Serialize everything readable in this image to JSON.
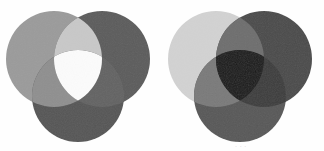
{
  "figure": {
    "width": 324,
    "height": 151,
    "background_color": "#fefefe",
    "panel_count": 2
  },
  "chart_data": {
    "type": "diagram",
    "subtype": "venn-3-set",
    "xlabel": "",
    "ylabel": "",
    "grid": false,
    "legend": "none",
    "panels": [
      {
        "name": "left-venn",
        "label": "additive",
        "blend_mode": "lighten",
        "center_region_color": "#fbfbfb",
        "sets": [
          {
            "id": "A",
            "label": "",
            "color": "#9b9b9b",
            "cx": 54,
            "cy": 59,
            "r": 48
          },
          {
            "id": "B",
            "label": "",
            "color": "#5c5c5c",
            "cx": 102,
            "cy": 59,
            "r": 48
          },
          {
            "id": "C",
            "label": "",
            "color": "#565656",
            "cx": 78,
            "cy": 96,
            "r": 46
          }
        ],
        "regions": [
          {
            "id": "A",
            "color": "#9b9b9b"
          },
          {
            "id": "B",
            "color": "#5c5c5c"
          },
          {
            "id": "C",
            "color": "#565656"
          },
          {
            "id": "AB",
            "color": "#c8c8c8"
          },
          {
            "id": "AC",
            "color": "#8f8f8f"
          },
          {
            "id": "BC",
            "color": "#636363"
          },
          {
            "id": "ABC",
            "color": "#fbfbfb"
          }
        ]
      },
      {
        "name": "right-venn",
        "label": "subtractive",
        "blend_mode": "multiply",
        "center_region_color": "#1a1a1a",
        "sets": [
          {
            "id": "A",
            "label": "",
            "color": "#d2d2d2",
            "cx": 54,
            "cy": 59,
            "r": 48
          },
          {
            "id": "B",
            "label": "",
            "color": "#4b4b4b",
            "cx": 102,
            "cy": 59,
            "r": 48
          },
          {
            "id": "C",
            "label": "",
            "color": "#585858",
            "cx": 78,
            "cy": 96,
            "r": 46
          }
        ],
        "regions": [
          {
            "id": "A",
            "color": "#d2d2d2"
          },
          {
            "id": "B",
            "color": "#4b4b4b"
          },
          {
            "id": "C",
            "color": "#585858"
          },
          {
            "id": "AB",
            "color": "#6e6e6e"
          },
          {
            "id": "AC",
            "color": "#7a7a7a"
          },
          {
            "id": "BC",
            "color": "#3d3d3d"
          },
          {
            "id": "ABC",
            "color": "#1a1a1a"
          }
        ]
      }
    ]
  },
  "panels": {
    "left": {
      "name": "left-venn",
      "offset_x": 0,
      "caption": ""
    },
    "right": {
      "name": "right-venn",
      "offset_x": 162,
      "caption": "· · ·",
      "caption_x": 235,
      "caption_y": 143
    }
  }
}
